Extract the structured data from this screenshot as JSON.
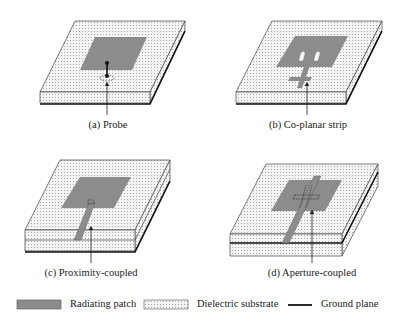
{
  "figure": {
    "panels": [
      {
        "id": "a",
        "caption": "(a) Probe",
        "feed_type": "probe"
      },
      {
        "id": "b",
        "caption": "(b) Co-planar strip",
        "feed_type": "co-planar strip"
      },
      {
        "id": "c",
        "caption": "(c) Proximity-coupled",
        "feed_type": "proximity-coupled"
      },
      {
        "id": "d",
        "caption": "(d) Aperture-coupled",
        "feed_type": "aperture-coupled"
      }
    ],
    "legend": [
      {
        "label": "Radiating patch",
        "swatch": "patch"
      },
      {
        "label": "Dielectric substrate",
        "swatch": "substrate"
      },
      {
        "label": "Ground plane",
        "swatch": "ground-line"
      }
    ],
    "colors": {
      "patch": "#8c8c8c",
      "substrate": "#f2f2f2",
      "substrate_dots": "#9a9a9a",
      "outline": "#333333",
      "ground": "#111111"
    }
  }
}
